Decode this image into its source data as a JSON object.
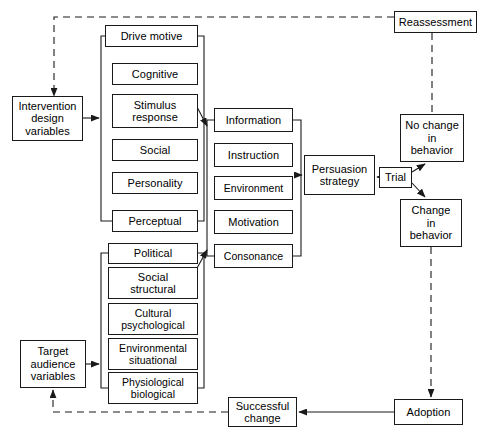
{
  "diagram": {
    "style": {
      "background": "#ffffff",
      "stroke": "#1a1a1a",
      "text": "#000000",
      "dashed_pattern": "7,5"
    },
    "nodes": [
      {
        "id": "intervention-design-variables",
        "label": "Intervention\ndesign\nvariables",
        "x": 12,
        "y": 96,
        "w": 71,
        "h": 45
      },
      {
        "id": "target-audience-variables",
        "label": "Target\naudience\nvariables",
        "x": 20,
        "y": 340,
        "w": 66,
        "h": 48
      },
      {
        "id": "drive-motive",
        "label": "Drive motive",
        "x": 105,
        "y": 25,
        "w": 93,
        "h": 22
      },
      {
        "id": "cognitive",
        "label": "Cognitive",
        "x": 112,
        "y": 63,
        "w": 86,
        "h": 22
      },
      {
        "id": "stimulus-response",
        "label": "Stimulus\nresponse",
        "x": 112,
        "y": 94,
        "w": 86,
        "h": 34
      },
      {
        "id": "social",
        "label": "Social",
        "x": 112,
        "y": 139,
        "w": 86,
        "h": 22
      },
      {
        "id": "personality",
        "label": "Personality",
        "x": 112,
        "y": 172,
        "w": 86,
        "h": 22
      },
      {
        "id": "perceptual",
        "label": "Perceptual",
        "x": 112,
        "y": 210,
        "w": 86,
        "h": 22
      },
      {
        "id": "political",
        "label": "Political",
        "x": 108,
        "y": 243,
        "w": 90,
        "h": 21
      },
      {
        "id": "social-structural",
        "label": "Social\nstructural",
        "x": 108,
        "y": 267,
        "w": 90,
        "h": 32
      },
      {
        "id": "cultural-psychological",
        "label": "Cultural\npsychological",
        "x": 108,
        "y": 303,
        "w": 90,
        "h": 32
      },
      {
        "id": "environmental-situational",
        "label": "Environmental\nsituational",
        "x": 108,
        "y": 338,
        "w": 90,
        "h": 32
      },
      {
        "id": "physiological-biological",
        "label": "Physiological\nbiological",
        "x": 108,
        "y": 372,
        "w": 90,
        "h": 32
      },
      {
        "id": "information",
        "label": "Information",
        "x": 214,
        "y": 108,
        "w": 79,
        "h": 24
      },
      {
        "id": "instruction",
        "label": "Instruction",
        "x": 214,
        "y": 143,
        "w": 79,
        "h": 24
      },
      {
        "id": "environment",
        "label": "Environment",
        "x": 214,
        "y": 176,
        "w": 79,
        "h": 24
      },
      {
        "id": "motivation",
        "label": "Motivation",
        "x": 214,
        "y": 210,
        "w": 79,
        "h": 24
      },
      {
        "id": "consonance",
        "label": "Consonance",
        "x": 214,
        "y": 244,
        "w": 79,
        "h": 24
      },
      {
        "id": "persuasion-strategy",
        "label": "Persuasion\nstrategy",
        "x": 304,
        "y": 155,
        "w": 71,
        "h": 40
      },
      {
        "id": "trial",
        "label": "Trial",
        "x": 379,
        "y": 167,
        "w": 33,
        "h": 21
      },
      {
        "id": "no-change-in-behavior",
        "label": "No change\nin\nbehavior",
        "x": 400,
        "y": 114,
        "w": 64,
        "h": 48
      },
      {
        "id": "change-in-behavior",
        "label": "Change\nin\nbehavior",
        "x": 400,
        "y": 199,
        "w": 62,
        "h": 48
      },
      {
        "id": "reassessment",
        "label": "Reassessment",
        "x": 394,
        "y": 11,
        "w": 83,
        "h": 22
      },
      {
        "id": "adoption",
        "label": "Adoption",
        "x": 394,
        "y": 399,
        "w": 69,
        "h": 26
      },
      {
        "id": "successful-change",
        "label": "Successful\nchange",
        "x": 228,
        "y": 397,
        "w": 69,
        "h": 30
      }
    ],
    "edges": [
      {
        "id": "intervention-to-motive-group",
        "from": "intervention-design-variables",
        "to": "drive-motive-group",
        "style": "solid",
        "arrow": true
      },
      {
        "id": "target-to-structural-group",
        "from": "target-audience-variables",
        "to": "political-group",
        "style": "solid",
        "arrow": true
      },
      {
        "id": "motive-group-to-information",
        "from": "drive-motive-group",
        "to": "information",
        "style": "solid",
        "arrow": true
      },
      {
        "id": "structural-group-to-consonance",
        "from": "political-group",
        "to": "consonance",
        "style": "solid",
        "arrow": true
      },
      {
        "id": "message-group-to-persuasion-strategy",
        "from": "information-group",
        "to": "persuasion-strategy",
        "style": "solid",
        "arrow": true
      },
      {
        "id": "trial-to-persuasion-strategy",
        "from": "trial",
        "to": "persuasion-strategy",
        "style": "solid",
        "arrow": true
      },
      {
        "id": "trial-to-no-change",
        "from": "trial",
        "to": "no-change-in-behavior",
        "style": "solid",
        "arrow": true
      },
      {
        "id": "trial-to-change",
        "from": "trial",
        "to": "change-in-behavior",
        "style": "solid",
        "arrow": true
      },
      {
        "id": "reassessment-to-no-change",
        "from": "reassessment",
        "to": "no-change-in-behavior",
        "style": "dashed",
        "arrow": false
      },
      {
        "id": "reassessment-to-intervention",
        "from": "reassessment",
        "to": "intervention-design-variables",
        "style": "dashed",
        "arrow": true
      },
      {
        "id": "change-to-adoption",
        "from": "change-in-behavior",
        "to": "adoption",
        "style": "dashed",
        "arrow": true
      },
      {
        "id": "adoption-to-successful-change",
        "from": "adoption",
        "to": "successful-change",
        "style": "solid",
        "arrow": true
      },
      {
        "id": "successful-change-to-target",
        "from": "successful-change",
        "to": "target-audience-variables",
        "style": "dashed",
        "arrow": true
      }
    ]
  }
}
